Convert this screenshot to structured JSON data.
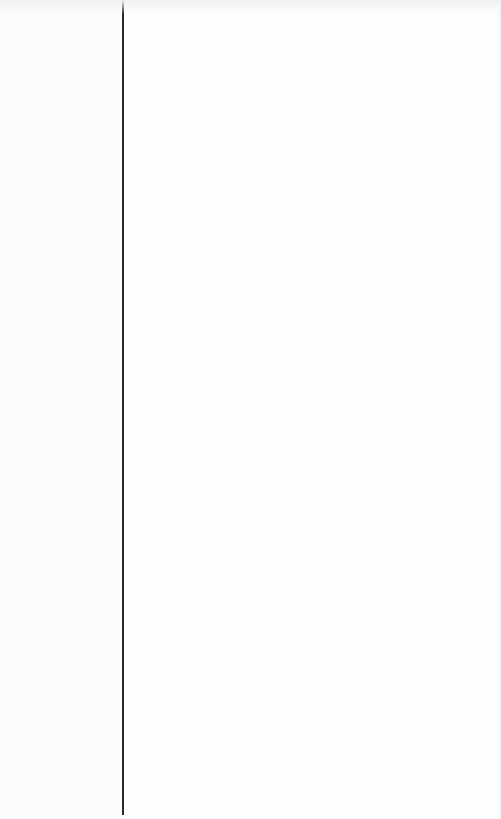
{
  "window": {
    "state": "blank",
    "layout": "split-pane"
  },
  "sidebar": {
    "width_px": 122,
    "items": []
  },
  "divider": {
    "x_px": 122,
    "color": "#2b2b2b"
  },
  "content": {
    "items": []
  },
  "colors": {
    "background": "#fdfdfd",
    "divider": "#2b2b2b"
  }
}
